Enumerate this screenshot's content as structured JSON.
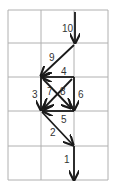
{
  "diagram": {
    "grid": {
      "cols_x": [
        8,
        41,
        74,
        108
      ],
      "rows_y": [
        10,
        43,
        77,
        111,
        146,
        180
      ],
      "line_color": "#b0b0b0"
    },
    "arrow_color": "#1a1a1a",
    "arrows": [
      {
        "label": "10",
        "x1": 75,
        "y1": 12,
        "x2": 75,
        "y2": 43,
        "lx": 62,
        "ly": 32
      },
      {
        "label": "9",
        "x1": 74,
        "y1": 45,
        "x2": 41,
        "y2": 76,
        "lx": 49,
        "ly": 61
      },
      {
        "label": "4",
        "x1": 74,
        "y1": 77,
        "x2": 42,
        "y2": 77,
        "lx": 61,
        "ly": 75
      },
      {
        "label": "3",
        "x1": 41,
        "y1": 77,
        "x2": 41,
        "y2": 110,
        "lx": 32,
        "ly": 98
      },
      {
        "label": "6",
        "x1": 74,
        "y1": 77,
        "x2": 74,
        "y2": 110,
        "lx": 78,
        "ly": 98
      },
      {
        "label": "7",
        "x1": 72,
        "y1": 79,
        "x2": 44,
        "y2": 108,
        "lx": 47,
        "ly": 95
      },
      {
        "label": "8",
        "x1": 43,
        "y1": 79,
        "x2": 71,
        "y2": 108,
        "lx": 60,
        "ly": 95
      },
      {
        "label": "5",
        "x1": 74,
        "y1": 111,
        "x2": 43,
        "y2": 111,
        "lx": 61,
        "ly": 123
      },
      {
        "label": "2",
        "x1": 42,
        "y1": 112,
        "x2": 73,
        "y2": 145,
        "lx": 50,
        "ly": 136
      },
      {
        "label": "1",
        "x1": 74,
        "y1": 146,
        "x2": 74,
        "y2": 180,
        "lx": 64,
        "ly": 163
      }
    ]
  }
}
